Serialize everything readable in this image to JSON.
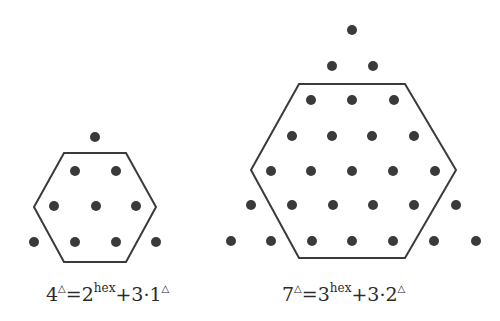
{
  "colors": {
    "dot": "#3a3a3a",
    "line": "#3a3a3a",
    "text": "#2a2a2a",
    "background": "#ffffff"
  },
  "figures": [
    {
      "id": "small",
      "label": "4-triangle",
      "hexagon": [
        [
          64,
          153
        ],
        [
          126,
          153
        ],
        [
          156,
          207
        ],
        [
          126,
          262
        ],
        [
          64,
          262
        ],
        [
          34,
          207
        ]
      ],
      "dots": [
        [
          95,
          137
        ],
        [
          75,
          171
        ],
        [
          116,
          171
        ],
        [
          54,
          206
        ],
        [
          96,
          206
        ],
        [
          136,
          206
        ],
        [
          34,
          242
        ],
        [
          75,
          242
        ],
        [
          116,
          242
        ],
        [
          156,
          242
        ]
      ],
      "caption": {
        "lhs_base": "4",
        "lhs_sup": "△",
        "eq": "=",
        "hex_base": "2",
        "hex_sup": "hex",
        "plus": "+3·",
        "tri_base": "1",
        "tri_sup": "△"
      }
    },
    {
      "id": "large",
      "label": "7-triangle",
      "hexagon": [
        [
          299,
          84
        ],
        [
          405,
          84
        ],
        [
          456,
          170
        ],
        [
          405,
          258
        ],
        [
          299,
          258
        ],
        [
          251,
          170
        ]
      ],
      "dots": [
        [
          352,
          30
        ],
        [
          332,
          66
        ],
        [
          373,
          66
        ],
        [
          311,
          100
        ],
        [
          352,
          100
        ],
        [
          394,
          100
        ],
        [
          292,
          136
        ],
        [
          332,
          136
        ],
        [
          372,
          136
        ],
        [
          414,
          136
        ],
        [
          271,
          171
        ],
        [
          311,
          171
        ],
        [
          352,
          171
        ],
        [
          393,
          171
        ],
        [
          435,
          171
        ],
        [
          251,
          205
        ],
        [
          292,
          205
        ],
        [
          333,
          205
        ],
        [
          373,
          205
        ],
        [
          414,
          205
        ],
        [
          456,
          205
        ],
        [
          231,
          241
        ],
        [
          271,
          241
        ],
        [
          312,
          241
        ],
        [
          352,
          241
        ],
        [
          393,
          241
        ],
        [
          434,
          241
        ],
        [
          476,
          241
        ]
      ],
      "caption": {
        "lhs_base": "7",
        "lhs_sup": "△",
        "eq": "=",
        "hex_base": "3",
        "hex_sup": "hex",
        "plus": "+3·",
        "tri_base": "2",
        "tri_sup": "△"
      }
    }
  ]
}
